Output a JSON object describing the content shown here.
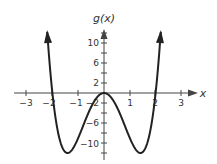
{
  "chart_data": {
    "type": "line",
    "title": "",
    "xlabel": "x",
    "ylabel": "g(x)",
    "function": "g(x) = 3x^4 - 12x^2",
    "xlim": [
      -3,
      3
    ],
    "ylim": [
      -12,
      12
    ],
    "x_ticks": [
      -3,
      -2,
      -1,
      1,
      2,
      3
    ],
    "y_ticks": [
      10,
      6,
      2,
      -2,
      -6,
      -10
    ],
    "series": [
      {
        "name": "g(x)",
        "x": [
          -2.15,
          -2,
          -1.5,
          -1.414,
          -1,
          -0.5,
          0,
          0.5,
          1,
          1.414,
          1.5,
          2,
          2.15
        ],
        "values": [
          13.6,
          0,
          -11.8,
          -12,
          -9,
          -2.8,
          0,
          -2.8,
          -9,
          -12,
          -11.8,
          0,
          13.6
        ]
      }
    ],
    "key_points": {
      "zeros": [
        -2,
        0,
        2
      ],
      "local_max": [
        0,
        0
      ],
      "local_min": [
        [
          -1.414,
          -12
        ],
        [
          1.414,
          -12
        ]
      ]
    },
    "grid": false,
    "arrows": "both ends of curve and positive ends of axes"
  },
  "labels": {
    "y_axis": "g(x)",
    "x_axis": "x",
    "x_ticks": [
      "−3",
      "−2",
      "−1",
      "1",
      "2",
      "3"
    ],
    "y_ticks": [
      "10",
      "6",
      "2",
      "−2",
      "−6",
      "−10"
    ]
  },
  "colors": {
    "curve": "#222222",
    "axis": "#444444"
  }
}
